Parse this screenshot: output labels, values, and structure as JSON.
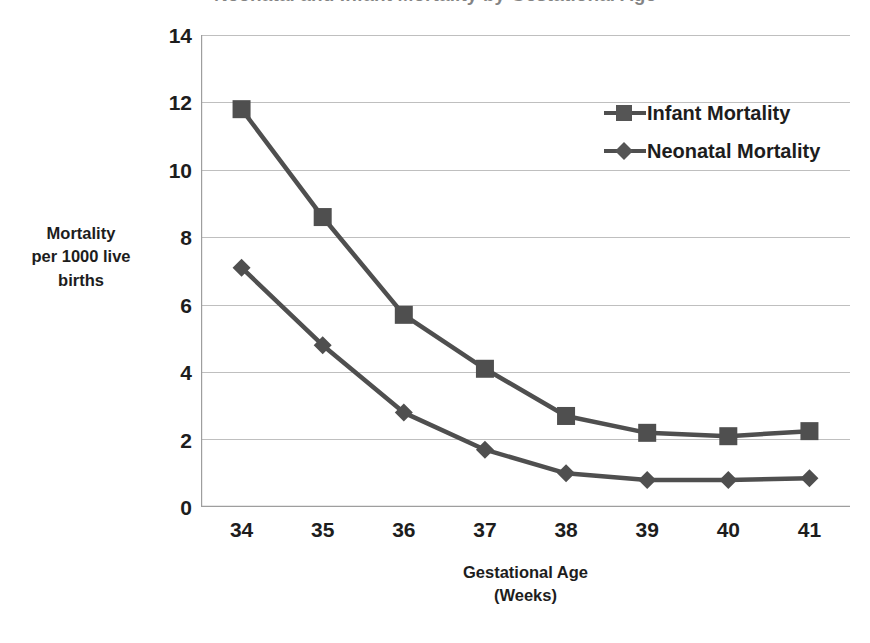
{
  "chart_data": {
    "type": "line",
    "title": "Neonatal and Infant Mortality by Gestational Age",
    "xlabel": "Gestational Age (Weeks)",
    "ylabel": "Mortality per 1000 live births",
    "categories": [
      34,
      35,
      36,
      37,
      38,
      39,
      40,
      41
    ],
    "xlim": [
      33.5,
      41.5
    ],
    "ylim": [
      0,
      14
    ],
    "ytick_values": [
      0,
      2,
      4,
      6,
      8,
      10,
      12,
      14
    ],
    "xtick_labels": [
      "34",
      "35",
      "36",
      "37",
      "38",
      "39",
      "40",
      "41"
    ],
    "ytick_labels": [
      "0",
      "2",
      "4",
      "6",
      "8",
      "10",
      "12",
      "14"
    ],
    "grid": "horizontal",
    "legend_position": "upper right",
    "series": [
      {
        "name": "Infant Mortality",
        "marker": "square",
        "color": "#4f4f4f",
        "values": [
          11.8,
          8.6,
          5.7,
          4.1,
          2.7,
          2.2,
          2.1,
          2.25
        ]
      },
      {
        "name": "Neonatal Mortality",
        "marker": "diamond",
        "color": "#4f4f4f",
        "values": [
          7.1,
          4.8,
          2.8,
          1.7,
          1.0,
          0.8,
          0.8,
          0.85
        ]
      }
    ]
  },
  "axis": {
    "y_title_lines": [
      "Mortality",
      "per 1000 live",
      "births"
    ],
    "x_title_lines": [
      "Gestational Age",
      "(Weeks)"
    ]
  },
  "style": {
    "series_color": "#4f4f4f",
    "grid_color": "#bfbfbf",
    "axis_color": "#808080",
    "text_color": "#1d1d1d",
    "background": "#ffffff"
  }
}
